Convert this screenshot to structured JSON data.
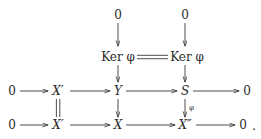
{
  "diagram": {
    "type": "commutative-diagram",
    "nodes": [
      {
        "id": "zero-top-mid",
        "label": "0",
        "x": 118,
        "y": 15,
        "style": "upright"
      },
      {
        "id": "zero-top-right",
        "label": "0",
        "x": 185,
        "y": 15,
        "style": "upright"
      },
      {
        "id": "ker-phi-mid",
        "label": "Ker φ",
        "x": 118,
        "y": 57,
        "style": "upright"
      },
      {
        "id": "ker-phi-right",
        "label": "Ker φ",
        "x": 187,
        "y": 57,
        "style": "upright"
      },
      {
        "id": "zero-r1-left",
        "label": "0",
        "x": 12,
        "y": 91,
        "style": "upright"
      },
      {
        "id": "x-prime-r1",
        "label": "X′",
        "x": 58,
        "y": 91,
        "style": "italic"
      },
      {
        "id": "y-r1",
        "label": "Y",
        "x": 118,
        "y": 91,
        "style": "italic"
      },
      {
        "id": "s-r1",
        "label": "S",
        "x": 185,
        "y": 91,
        "style": "italic"
      },
      {
        "id": "zero-r1-right",
        "label": "0",
        "x": 247,
        "y": 91,
        "style": "upright"
      },
      {
        "id": "zero-r2-left",
        "label": "0",
        "x": 12,
        "y": 125,
        "style": "upright"
      },
      {
        "id": "x-prime-r2",
        "label": "X′",
        "x": 58,
        "y": 125,
        "style": "italic"
      },
      {
        "id": "x-r2",
        "label": "X",
        "x": 118,
        "y": 125,
        "style": "italic"
      },
      {
        "id": "x-dprime-r2",
        "label": "X″",
        "x": 185,
        "y": 125,
        "style": "italic"
      },
      {
        "id": "zero-r2-right",
        "label": "0",
        "x": 243,
        "y": 125,
        "style": "upright"
      }
    ],
    "labels": [
      {
        "id": "phi-map-label",
        "label": "φ",
        "x": 189,
        "y": 108
      },
      {
        "id": "terminal-period",
        "label": ".",
        "x": 254,
        "y": 125
      }
    ],
    "edges": [
      {
        "id": "zero-to-ker-mid",
        "kind": "arrow-down",
        "from": "zero-top-mid",
        "to": "ker-phi-mid"
      },
      {
        "id": "zero-to-ker-right",
        "kind": "arrow-down",
        "from": "zero-top-right",
        "to": "ker-phi-right"
      },
      {
        "id": "ker-equals-ker",
        "kind": "double-line",
        "from": "ker-phi-mid",
        "to": "ker-phi-right"
      },
      {
        "id": "ker-to-y",
        "kind": "arrow-down",
        "from": "ker-phi-mid",
        "to": "y-r1"
      },
      {
        "id": "ker-to-s",
        "kind": "arrow-down",
        "from": "ker-phi-right",
        "to": "s-r1"
      },
      {
        "id": "zero-to-xprime-r1",
        "kind": "arrow-right",
        "from": "zero-r1-left",
        "to": "x-prime-r1"
      },
      {
        "id": "xprime-to-y",
        "kind": "arrow-right",
        "from": "x-prime-r1",
        "to": "y-r1"
      },
      {
        "id": "y-to-s",
        "kind": "arrow-right",
        "from": "y-r1",
        "to": "s-r1"
      },
      {
        "id": "s-to-zero-r1",
        "kind": "arrow-right",
        "from": "s-r1",
        "to": "zero-r1-right"
      },
      {
        "id": "xprime-equals-xprime",
        "kind": "double-vline",
        "from": "x-prime-r1",
        "to": "x-prime-r2"
      },
      {
        "id": "y-to-x",
        "kind": "arrow-down",
        "from": "y-r1",
        "to": "x-r2"
      },
      {
        "id": "s-to-xdprime",
        "kind": "arrow-down",
        "from": "s-r1",
        "to": "x-dprime-r2",
        "label": "φ"
      },
      {
        "id": "zero-to-xprime-r2",
        "kind": "arrow-right",
        "from": "zero-r2-left",
        "to": "x-prime-r2"
      },
      {
        "id": "xprime-to-x",
        "kind": "arrow-right",
        "from": "x-prime-r2",
        "to": "x-r2"
      },
      {
        "id": "x-to-xdprime",
        "kind": "arrow-right",
        "from": "x-r2",
        "to": "x-dprime-r2"
      },
      {
        "id": "xdprime-to-zero-r2",
        "kind": "arrow-right",
        "from": "x-dprime-r2",
        "to": "zero-r2-right"
      }
    ],
    "colors": {
      "background": "#ffffff",
      "ink": "#2b2b2b",
      "stroke": "#3a3a3a"
    }
  }
}
